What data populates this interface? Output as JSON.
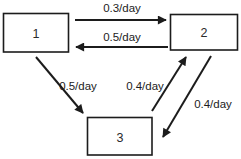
{
  "diagram": {
    "type": "compartment-flow-diagram",
    "colors": {
      "line": "#1c1c1c",
      "box_fill": "#ffffff",
      "background": "#ffffff"
    },
    "nodes": [
      {
        "id": "1",
        "label": "1",
        "position": "top-left"
      },
      {
        "id": "2",
        "label": "2",
        "position": "top-right"
      },
      {
        "id": "3",
        "label": "3",
        "position": "bottom-center"
      }
    ],
    "edges": [
      {
        "from": "1",
        "to": "2",
        "label": "0.3/day"
      },
      {
        "from": "2",
        "to": "1",
        "label": "0.5/day"
      },
      {
        "from": "1",
        "to": "3",
        "label": "0.5/day"
      },
      {
        "from": "3",
        "to": "2",
        "label": "0.4/day"
      },
      {
        "from": "2",
        "to": "3",
        "label": "0.4/day"
      }
    ]
  }
}
